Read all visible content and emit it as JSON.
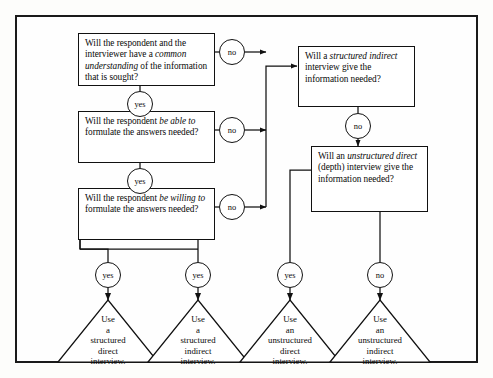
{
  "diagram": {
    "questions": [
      {
        "id": "q1",
        "text_html": "Will the respondent and the interviewer have a <em>common understanding</em> of the information that is sought?",
        "yes_label": "yes",
        "no_label": "no"
      },
      {
        "id": "q2",
        "text_html": "Will the respondent <em>be able to</em> formulate the answers needed?",
        "yes_label": "yes",
        "no_label": "no"
      },
      {
        "id": "q3",
        "text_html": "Will the respondent <em>be willing to</em> formulate the answers needed?",
        "yes_label": "yes",
        "no_label": "no"
      },
      {
        "id": "q4",
        "text_html": "Will a <em>structured indirect</em> interview give the information needed?",
        "yes_label": "yes",
        "no_label": "no"
      },
      {
        "id": "q5",
        "text_html": "Will an <em>unstructured direct</em> (depth) interview give the information needed?",
        "yes_label": "yes",
        "no_label": "no"
      }
    ],
    "decisions": {
      "q1_no": "no",
      "q1_yes": "yes",
      "q2_no": "no",
      "q2_yes": "yes",
      "q3_no": "no",
      "q3_yes": "yes",
      "q4_no": "no",
      "q5_yes": "yes",
      "q5_no": "no"
    },
    "outcomes": [
      {
        "id": "o1",
        "entry_label": "yes",
        "text": "Use a structured direct interview."
      },
      {
        "id": "o2",
        "entry_label": "yes",
        "text": "Use a structured indirect interview."
      },
      {
        "id": "o3",
        "entry_label": "yes",
        "text": "Use an unstructured direct interview."
      },
      {
        "id": "o4",
        "entry_label": "no",
        "text": "Use an unstructured indirect interview."
      }
    ],
    "colors": {
      "line": "#111111",
      "frame": "#1a1a1a",
      "box_fill": "#ffffff",
      "page": "#fdfdfb"
    }
  }
}
